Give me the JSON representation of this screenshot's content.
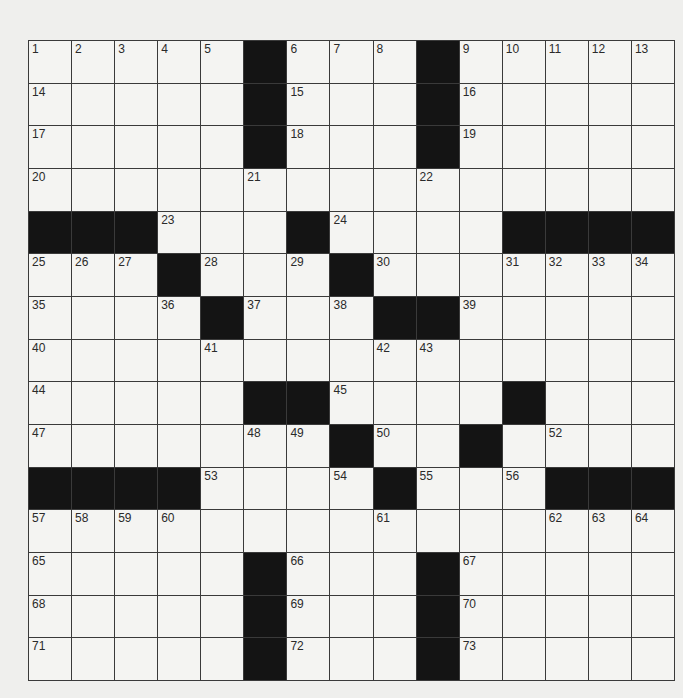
{
  "puzzle": {
    "rows": 15,
    "cols": 15,
    "grid": [
      "00000#000#00000",
      "00000#000#00000",
      "00000#000#00000",
      "000000000000000",
      "###000#0000####",
      "000#000#0000000",
      "0000#000##00000",
      "000000000000000",
      "00000##0000#000",
      "0000000#00#0000",
      "####0000#000###",
      "000000000000000",
      "00000#000#00000",
      "00000#000#00000",
      "00000#000#00000"
    ],
    "numbers": [
      [
        [
          0,
          0,
          1
        ],
        [
          0,
          1,
          2
        ],
        [
          0,
          2,
          3
        ],
        [
          0,
          3,
          4
        ],
        [
          0,
          4,
          5
        ],
        [
          0,
          6,
          6
        ],
        [
          0,
          7,
          7
        ],
        [
          0,
          8,
          8
        ],
        [
          0,
          10,
          9
        ],
        [
          0,
          11,
          10
        ],
        [
          0,
          12,
          11
        ],
        [
          0,
          13,
          12
        ],
        [
          0,
          14,
          13
        ]
      ],
      [
        [
          1,
          0,
          14
        ],
        [
          1,
          6,
          15
        ],
        [
          1,
          10,
          16
        ]
      ],
      [
        [
          2,
          0,
          17
        ],
        [
          2,
          6,
          18
        ],
        [
          2,
          10,
          19
        ]
      ],
      [
        [
          3,
          0,
          20
        ],
        [
          3,
          5,
          21
        ],
        [
          3,
          9,
          22
        ]
      ],
      [
        [
          4,
          3,
          23
        ],
        [
          4,
          7,
          24
        ]
      ],
      [
        [
          5,
          0,
          25
        ],
        [
          5,
          1,
          26
        ],
        [
          5,
          2,
          27
        ],
        [
          5,
          4,
          28
        ],
        [
          5,
          6,
          29
        ],
        [
          5,
          8,
          30
        ],
        [
          5,
          11,
          31
        ],
        [
          5,
          12,
          32
        ],
        [
          5,
          13,
          33
        ],
        [
          5,
          14,
          34
        ]
      ],
      [
        [
          6,
          0,
          35
        ],
        [
          6,
          3,
          36
        ],
        [
          6,
          5,
          37
        ],
        [
          6,
          7,
          38
        ],
        [
          6,
          10,
          39
        ]
      ],
      [
        [
          7,
          0,
          40
        ],
        [
          7,
          4,
          41
        ],
        [
          7,
          8,
          42
        ],
        [
          7,
          9,
          43
        ]
      ],
      [
        [
          8,
          0,
          44
        ],
        [
          8,
          7,
          45
        ],
        [
          8,
          11,
          46
        ]
      ],
      [
        [
          9,
          0,
          47
        ],
        [
          9,
          5,
          48
        ],
        [
          9,
          6,
          49
        ],
        [
          9,
          8,
          50
        ],
        [
          9,
          10,
          51
        ],
        [
          9,
          12,
          52
        ]
      ],
      [
        [
          10,
          4,
          53
        ],
        [
          10,
          7,
          54
        ],
        [
          10,
          9,
          55
        ],
        [
          10,
          11,
          56
        ]
      ],
      [
        [
          11,
          0,
          57
        ],
        [
          11,
          1,
          58
        ],
        [
          11,
          2,
          59
        ],
        [
          11,
          3,
          60
        ],
        [
          11,
          8,
          61
        ],
        [
          11,
          12,
          62
        ],
        [
          11,
          13,
          63
        ],
        [
          11,
          14,
          64
        ]
      ],
      [
        [
          12,
          0,
          65
        ],
        [
          12,
          6,
          66
        ],
        [
          12,
          10,
          67
        ]
      ],
      [
        [
          13,
          0,
          68
        ],
        [
          13,
          6,
          69
        ],
        [
          13,
          10,
          70
        ]
      ],
      [
        [
          14,
          0,
          71
        ],
        [
          14,
          6,
          72
        ],
        [
          14,
          10,
          73
        ]
      ]
    ],
    "entries": {}
  },
  "colors": {
    "block": "#141414",
    "cell": "#f4f4f2",
    "gridline": "#3a3a3a"
  }
}
